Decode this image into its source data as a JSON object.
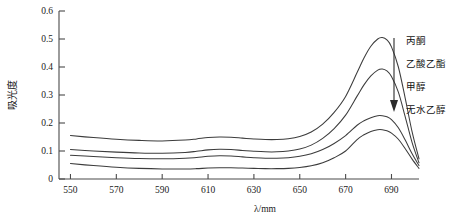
{
  "chart_data": {
    "type": "line",
    "title": "",
    "xlabel": "λ/mm",
    "ylabel": "吸光度",
    "xlim": [
      545,
      702
    ],
    "ylim": [
      0,
      0.6
    ],
    "grid": false,
    "legend_position": "right-inside",
    "legend_note": "箭头自上而下指示峰高依次降低",
    "xticks": [
      550,
      570,
      590,
      610,
      630,
      650,
      670,
      690
    ],
    "yticks": [
      "0",
      "0.1",
      "0.2",
      "0.3",
      "0.4",
      "0.5",
      "0.6"
    ],
    "ytick_values": [
      0,
      0.1,
      0.2,
      0.3,
      0.4,
      0.5,
      0.6
    ],
    "x": [
      550,
      560,
      570,
      580,
      590,
      600,
      605,
      610,
      615,
      620,
      625,
      630,
      635,
      640,
      645,
      650,
      655,
      660,
      665,
      670,
      675,
      678,
      681,
      684,
      686,
      688,
      690,
      693,
      696,
      699,
      702
    ],
    "series": [
      {
        "name": "丙酮",
        "label": "丙酮",
        "color": "#3c3c3c",
        "peak_x": 684,
        "peak_y": 0.505,
        "values": [
          0.155,
          0.148,
          0.142,
          0.138,
          0.136,
          0.139,
          0.143,
          0.148,
          0.15,
          0.149,
          0.146,
          0.143,
          0.141,
          0.141,
          0.144,
          0.152,
          0.168,
          0.196,
          0.238,
          0.295,
          0.38,
          0.432,
          0.474,
          0.5,
          0.505,
          0.497,
          0.472,
          0.4,
          0.288,
          0.168,
          0.072
        ]
      },
      {
        "name": "乙酸乙酯",
        "label": "乙酸乙酯",
        "color": "#3c3c3c",
        "peak_x": 684,
        "peak_y": 0.393,
        "values": [
          0.105,
          0.1,
          0.096,
          0.093,
          0.092,
          0.095,
          0.099,
          0.104,
          0.106,
          0.105,
          0.102,
          0.099,
          0.097,
          0.097,
          0.1,
          0.107,
          0.121,
          0.145,
          0.18,
          0.228,
          0.296,
          0.336,
          0.368,
          0.389,
          0.393,
          0.386,
          0.366,
          0.31,
          0.222,
          0.13,
          0.058
        ]
      },
      {
        "name": "甲醇",
        "label": "甲醇",
        "color": "#3c3c3c",
        "peak_x": 683,
        "peak_y": 0.226,
        "values": [
          0.085,
          0.08,
          0.076,
          0.073,
          0.072,
          0.074,
          0.077,
          0.081,
          0.083,
          0.082,
          0.079,
          0.076,
          0.074,
          0.074,
          0.076,
          0.081,
          0.09,
          0.105,
          0.127,
          0.155,
          0.192,
          0.208,
          0.219,
          0.226,
          0.226,
          0.222,
          0.212,
          0.183,
          0.139,
          0.09,
          0.048
        ]
      },
      {
        "name": "无水乙醇",
        "label": "无水乙醇",
        "color": "#3c3c3c",
        "peak_x": 683,
        "peak_y": 0.176,
        "values": [
          0.055,
          0.048,
          0.042,
          0.038,
          0.036,
          0.036,
          0.037,
          0.039,
          0.04,
          0.04,
          0.039,
          0.038,
          0.037,
          0.037,
          0.038,
          0.041,
          0.047,
          0.058,
          0.076,
          0.1,
          0.141,
          0.158,
          0.17,
          0.176,
          0.176,
          0.172,
          0.164,
          0.142,
          0.108,
          0.071,
          0.038
        ]
      }
    ]
  },
  "legend": {
    "arrow_icon": "arrow-down-icon",
    "items": [
      {
        "label": "丙酮"
      },
      {
        "label": "乙酸乙酯"
      },
      {
        "label": "甲醇"
      },
      {
        "label": "无水乙醇"
      }
    ]
  }
}
